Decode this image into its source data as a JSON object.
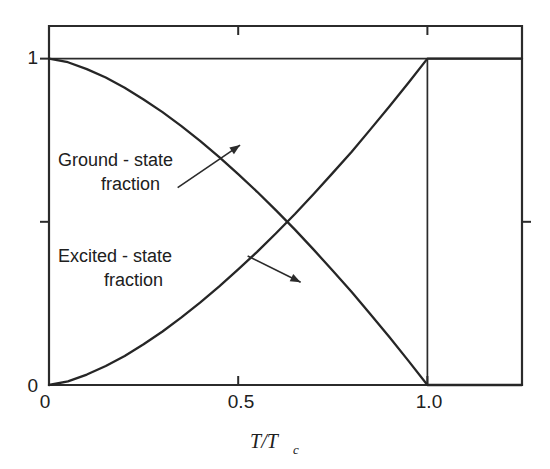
{
  "chart_data": {
    "type": "line",
    "title": "",
    "subtitle": "",
    "xlabel": "T/T_c",
    "xlabel_main": "T/T",
    "xlabel_sub": "c",
    "ylabel": "",
    "xlim": [
      0,
      1.25
    ],
    "ylim": [
      0,
      1.1
    ],
    "grid": false,
    "legend_position": "inline-annotations",
    "x_ticks": [
      {
        "value": 0,
        "label": "0"
      },
      {
        "value": 0.5,
        "label": "0.5"
      },
      {
        "value": 1.0,
        "label": "1.0"
      },
      {
        "value": 1.25,
        "label": ""
      }
    ],
    "y_ticks": [
      {
        "value": 0,
        "label": "0"
      },
      {
        "value": 0.5,
        "label": ""
      },
      {
        "value": 1,
        "label": "1"
      }
    ],
    "series": [
      {
        "name": "Ground - state fraction",
        "color": "#262626",
        "x": [
          0.0,
          0.05,
          0.1,
          0.15,
          0.2,
          0.25,
          0.3,
          0.35,
          0.4,
          0.45,
          0.5,
          0.55,
          0.6,
          0.65,
          0.7,
          0.75,
          0.8,
          0.85,
          0.9,
          0.95,
          1.0,
          1.05,
          1.1,
          1.15,
          1.2,
          1.25
        ],
        "values": [
          1.0,
          0.989,
          0.968,
          0.942,
          0.911,
          0.875,
          0.836,
          0.793,
          0.747,
          0.698,
          0.646,
          0.592,
          0.535,
          0.476,
          0.414,
          0.35,
          0.285,
          0.216,
          0.146,
          0.074,
          0.0,
          0.0,
          0.0,
          0.0,
          0.0,
          0.0
        ]
      },
      {
        "name": "Excited - state fraction",
        "color": "#262626",
        "x": [
          0.0,
          0.05,
          0.1,
          0.15,
          0.2,
          0.25,
          0.3,
          0.35,
          0.4,
          0.45,
          0.5,
          0.55,
          0.6,
          0.65,
          0.7,
          0.75,
          0.8,
          0.85,
          0.9,
          0.95,
          1.0,
          1.05,
          1.1,
          1.15,
          1.2,
          1.25
        ],
        "values": [
          0.0,
          0.011,
          0.032,
          0.058,
          0.089,
          0.125,
          0.164,
          0.207,
          0.253,
          0.302,
          0.354,
          0.408,
          0.465,
          0.524,
          0.586,
          0.65,
          0.715,
          0.784,
          0.854,
          0.926,
          1.0,
          1.0,
          1.0,
          1.0,
          1.0,
          1.0
        ]
      }
    ],
    "annotations": [
      {
        "id": "ground-state",
        "line1": "Ground - state",
        "line2": "fraction",
        "arrow_from": [
          0.34,
          0.605
        ],
        "arrow_to": [
          0.505,
          0.735
        ]
      },
      {
        "id": "excited-state",
        "line1": "Excited - state",
        "line2": "fraction",
        "arrow_from": [
          0.525,
          0.395
        ],
        "arrow_to": [
          0.665,
          0.315
        ]
      }
    ],
    "reference_lines": [
      {
        "id": "y-equals-one",
        "orientation": "horizontal",
        "value": 1.0,
        "from": 0.0,
        "to": 1.25
      },
      {
        "id": "t-equals-tc",
        "orientation": "vertical",
        "value": 1.0,
        "from": 0.0,
        "to": 1.0
      }
    ]
  }
}
